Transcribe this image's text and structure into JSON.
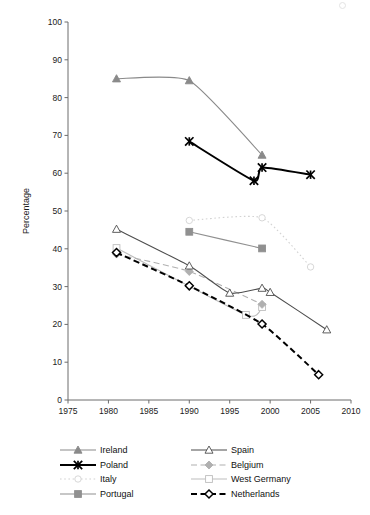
{
  "chart_data": {
    "type": "line",
    "title": "",
    "xlabel": "",
    "ylabel": "Percentage",
    "xlim": [
      1975,
      2010
    ],
    "ylim": [
      0,
      100
    ],
    "xticks": [
      1975,
      1980,
      1985,
      1990,
      1995,
      2000,
      2005,
      2010
    ],
    "yticks": [
      0,
      10,
      20,
      30,
      40,
      50,
      60,
      70,
      80,
      90,
      100
    ],
    "grid": false,
    "legend_position": "below",
    "series": [
      {
        "name": "Ireland",
        "color": "#8a8a8a",
        "marker": "triangle-filled",
        "dash": "solid",
        "x": [
          1981,
          1990,
          1999
        ],
        "y": [
          85.0,
          84.5,
          64.8
        ]
      },
      {
        "name": "Spain",
        "color": "#4d4d4d",
        "marker": "triangle-open",
        "dash": "solid",
        "x": [
          1981,
          1990,
          1995,
          1999,
          2000,
          2007
        ],
        "y": [
          45.2,
          35.5,
          28.3,
          29.6,
          28.5,
          18.6
        ]
      },
      {
        "name": "Poland",
        "color": "#000000",
        "marker": "star",
        "dash": "solid",
        "x": [
          1990,
          1998,
          1999,
          2005
        ],
        "y": [
          68.4,
          58.0,
          61.5,
          59.6
        ]
      },
      {
        "name": "Belgium",
        "color": "#b0b0b0",
        "marker": "diamond-filled",
        "dash": "dashed",
        "x": [
          1981,
          1990,
          1999
        ],
        "y": [
          38.6,
          34.0,
          25.3
        ]
      },
      {
        "name": "Italy",
        "color": "#d2d2d2",
        "marker": "circle-open",
        "dash": "dotted",
        "x": [
          1990,
          1999,
          2005
        ],
        "y": [
          47.5,
          48.2,
          35.2
        ]
      },
      {
        "name": "West Germany",
        "color": "#bdbdbd",
        "marker": "square-open",
        "dash": "solid",
        "x": [
          1981,
          1997,
          1999
        ],
        "y": [
          40.2,
          22.5,
          24.6
        ]
      },
      {
        "name": "Portugal",
        "color": "#909090",
        "marker": "square-filled",
        "dash": "solid",
        "x": [
          1990,
          1999
        ],
        "y": [
          44.5,
          40.1
        ]
      },
      {
        "name": "Netherlands",
        "color": "#000000",
        "marker": "diamond-open",
        "dash": "dashed",
        "x": [
          1981,
          1990,
          1999,
          2006
        ],
        "y": [
          39.0,
          30.2,
          20.1,
          6.7
        ]
      }
    ]
  },
  "legend": {
    "rows": [
      [
        {
          "label": "Ireland",
          "key": "ireland"
        },
        {
          "label": "Spain",
          "key": "spain"
        }
      ],
      [
        {
          "label": "Poland",
          "key": "poland"
        },
        {
          "label": "Belgium",
          "key": "belgium"
        }
      ],
      [
        {
          "label": "Italy",
          "key": "italy"
        },
        {
          "label": "West Germany",
          "key": "west-germany"
        }
      ],
      [
        {
          "label": "Portugal",
          "key": "portugal"
        },
        {
          "label": "Netherlands",
          "key": "netherlands"
        }
      ]
    ]
  },
  "caption": ""
}
